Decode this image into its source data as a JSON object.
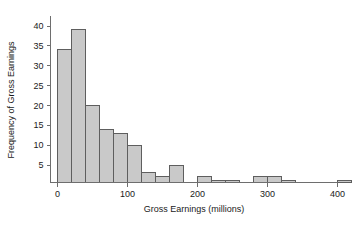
{
  "chart_data": {
    "type": "bar",
    "title": "",
    "subtitle": "",
    "xlabel": "Gross Earnings (millions)",
    "ylabel": "Frequency of Gross Earnings",
    "grid": false,
    "legend": null,
    "bin_width": 20,
    "xlim": [
      -10,
      430
    ],
    "ylim": [
      0,
      41
    ],
    "xticks": [
      0,
      100,
      200,
      300,
      400
    ],
    "xticklabels": [
      "0",
      "100",
      "200",
      "300",
      "400"
    ],
    "yticks": [
      5,
      10,
      15,
      20,
      25,
      30,
      35,
      40
    ],
    "yticklabels": [
      "5",
      "10",
      "15",
      "20",
      "25",
      "30",
      "35",
      "40"
    ],
    "bin_edges": [
      0,
      20,
      40,
      60,
      80,
      100,
      120,
      140,
      160,
      180,
      200,
      220,
      240,
      260,
      280,
      300,
      320,
      340,
      360,
      380,
      400,
      420
    ],
    "categories": [
      "0-20",
      "20-40",
      "40-60",
      "60-80",
      "80-100",
      "100-120",
      "120-140",
      "140-160",
      "160-180",
      "180-200",
      "200-220",
      "220-240",
      "240-260",
      "260-280",
      "280-300",
      "300-320",
      "320-340",
      "340-360",
      "360-380",
      "380-400",
      "400-420"
    ],
    "values": [
      34,
      39,
      20,
      14,
      13,
      10,
      3,
      2,
      5,
      0,
      2,
      1,
      1,
      0,
      2,
      2,
      1,
      0,
      0,
      0,
      1
    ],
    "bar_fill_color": "#c9c9c9",
    "bar_edge_color": "#5e5e5e",
    "axis_color": "#6e6e6e",
    "text_color": "#1a1a1a"
  }
}
